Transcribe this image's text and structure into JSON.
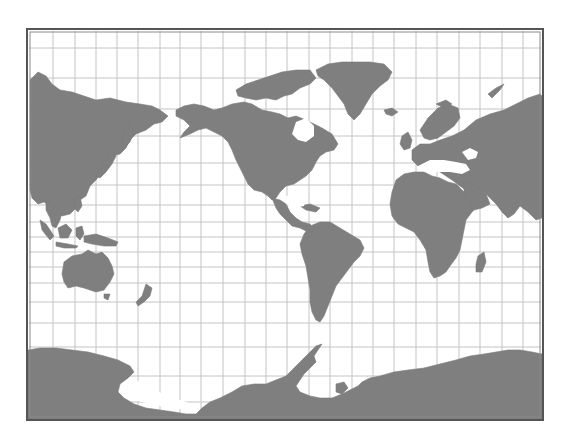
{
  "map": {
    "projection": "Mercator (Pacific-centered)",
    "colors": {
      "background": "#ffffff",
      "land": "#7f7f7f",
      "grid": "#c4c4c4",
      "frame": "#555555"
    },
    "frame": {
      "x": 27,
      "y": 29,
      "width": 516,
      "height": 391
    },
    "grid": {
      "meridians_x": [
        53,
        75,
        96,
        117,
        138,
        160,
        180,
        201,
        223,
        245,
        266,
        287,
        309,
        330,
        352,
        373,
        394,
        416,
        437,
        459,
        480,
        502,
        523
      ],
      "parallels_y": [
        48,
        78,
        109,
        136,
        163,
        185,
        205,
        222,
        237,
        252,
        267,
        283,
        302,
        323,
        347,
        376,
        402
      ]
    },
    "landmasses": [
      {
        "name": "asia-east",
        "points": "30,80 38,72 46,76 52,84 60,90 72,92 84,96 96,100 110,98 126,102 140,104 152,106 160,110 168,116 162,122 154,124 146,130 136,134 130,140 126,148 120,154 112,156 106,164 102,172 96,180 90,186 86,196 80,200 76,208 70,214 62,216 56,212 50,206 44,202 38,204 32,198 30,190"
      },
      {
        "name": "kamchatka",
        "points": "124,128 130,124 134,132 130,142 126,146 122,140"
      },
      {
        "name": "japan",
        "points": "108,154 112,150 116,156 112,164 106,172 100,178 96,176 102,168 106,160"
      },
      {
        "name": "indochina-malaysia",
        "points": "46,200 56,206 62,212 60,220 56,228 52,226 50,218 46,210"
      },
      {
        "name": "philippines",
        "points": "74,198 80,196 82,206 78,212 74,208"
      },
      {
        "name": "borneo",
        "points": "58,228 66,224 72,230 68,238 60,238"
      },
      {
        "name": "sumatra",
        "points": "40,220 46,224 54,236 50,240 42,230"
      },
      {
        "name": "java",
        "points": "56,242 68,244 78,246 76,248 64,248 56,246"
      },
      {
        "name": "sulawesi",
        "points": "76,228 82,226 84,234 80,240 76,236"
      },
      {
        "name": "new-guinea",
        "points": "84,236 96,234 108,238 118,242 116,246 104,246 92,244 84,242"
      },
      {
        "name": "australia",
        "points": "64,262 72,256 82,254 88,250 96,254 102,252 108,258 112,266 114,274 110,282 104,290 96,292 90,290 84,288 76,286 68,288 64,282 62,274"
      },
      {
        "name": "tasmania",
        "points": "104,294 110,294 108,300 104,298"
      },
      {
        "name": "new-zealand",
        "points": "146,284 152,288 150,296 144,302 138,306 136,302 142,296"
      },
      {
        "name": "alaska-canada-usa",
        "points": "176,110 184,106 194,104 204,106 214,110 222,108 232,104 244,102 252,104 262,110 272,112 280,114 288,118 296,116 306,120 314,124 322,128 332,134 338,144 334,150 326,152 320,156 316,162 312,170 306,176 300,180 294,184 286,186 280,192 276,198 272,200 268,196 262,192 254,190 248,184 244,176 240,168 236,160 232,150 228,142 222,136 214,132 206,128 198,130 190,134 180,138 184,132 190,126 184,120 176,116"
      },
      {
        "name": "canadian-arctic-islands",
        "points": "236,90 246,84 258,80 270,76 282,72 296,70 310,70 316,78 310,84 300,88 292,94 284,96 276,100 266,98 256,100 246,98 238,96"
      },
      {
        "name": "greenland",
        "points": "316,70 328,64 342,62 356,62 370,62 384,64 392,72 388,80 380,86 372,94 366,104 360,114 354,120 348,114 344,104 338,96 332,88 324,80 318,76"
      },
      {
        "name": "mexico-central-america",
        "points": "272,198 280,200 286,204 290,212 296,218 302,222 310,224 314,230 308,232 300,228 292,226 286,220 280,214 276,208"
      },
      {
        "name": "cuba",
        "points": "300,206 310,204 320,208 316,212 306,210"
      },
      {
        "name": "south-america",
        "points": "310,226 320,222 330,222 340,228 350,234 360,240 364,248 360,256 354,262 348,270 342,278 336,286 332,296 328,306 324,316 320,322 316,320 312,312 310,302 310,290 308,278 306,266 302,254 300,244 304,234"
      },
      {
        "name": "iceland",
        "points": "384,110 392,108 398,112 392,116 386,114"
      },
      {
        "name": "uk-ireland",
        "points": "402,136 408,132 412,140 410,148 404,150 400,144"
      },
      {
        "name": "scandinavia",
        "points": "420,130 428,118 438,108 448,104 458,108 460,118 454,126 446,132 438,138 430,140 424,138"
      },
      {
        "name": "eurasia-west",
        "points": "412,150 420,144 430,144 440,140 452,136 464,130 476,120 490,114 504,110 516,104 528,98 540,94 542,96 542,218 536,220 528,212 520,206 514,214 508,218 502,212 496,204 490,198 484,192 476,190 468,192 460,186 452,180 446,176 440,172 432,168 424,168 418,166 412,160"
      },
      {
        "name": "africa",
        "points": "396,180 404,174 414,172 424,172 432,176 440,178 448,182 456,184 464,192 472,198 478,206 472,212 466,220 464,230 462,240 460,250 456,258 450,266 446,272 440,276 434,278 430,272 428,262 426,250 420,240 414,232 406,228 398,224 392,216 390,204 392,192"
      },
      {
        "name": "arabia",
        "points": "464,182 476,186 486,194 490,204 482,208 474,210 468,200 464,192"
      },
      {
        "name": "madagascar",
        "points": "478,256 484,252 486,262 482,272 476,272 476,264"
      },
      {
        "name": "svalbard",
        "points": "436,104 446,100 452,104 444,108"
      },
      {
        "name": "novaya-zemlya",
        "points": "488,94 496,88 504,84 500,90 492,98"
      },
      {
        "name": "antarctica-west",
        "points": "28,350 40,348 56,348 72,350 88,352 104,356 118,360 130,366 134,372 128,378 120,384 118,392 124,398 134,404 146,408 160,410 174,412 186,414 196,414 202,408 210,402 220,398 232,392 242,386 254,384 266,384 276,380 286,376 292,370 298,364 304,358 310,352 316,346 322,344 318,350 314,356 316,362 310,368 304,374 300,380 296,386 300,392 310,396 320,398 332,398 342,394 350,390 358,386 362,382 370,378 380,376 394,372 408,370 424,368 440,364 456,360 470,356 484,354 496,352 508,350 520,350 532,352 542,354 542,420 28,420"
      },
      {
        "name": "antarctic-peninsula-islands",
        "points": "336,384 344,382 348,388 342,394 336,392"
      }
    ],
    "lakes": [
      {
        "name": "hudson-bay",
        "points": "296,122 306,118 314,126 314,136 306,142 298,140 292,134"
      },
      {
        "name": "mediterranean",
        "points": "418,166 430,160 444,160 456,162 466,164 470,170 462,174 450,172 438,172 426,172 418,170"
      },
      {
        "name": "black-caspian",
        "points": "462,152 470,148 478,152 476,158 468,160"
      },
      {
        "name": "gulf-of-mexico",
        "points": "286,196 298,194 306,198 304,206 294,208 286,204"
      },
      {
        "name": "ross-weddell-gap",
        "points": "122,384 136,380 150,388 168,396 186,402 196,406 188,410 170,408 150,404 134,400 124,394"
      }
    ]
  }
}
